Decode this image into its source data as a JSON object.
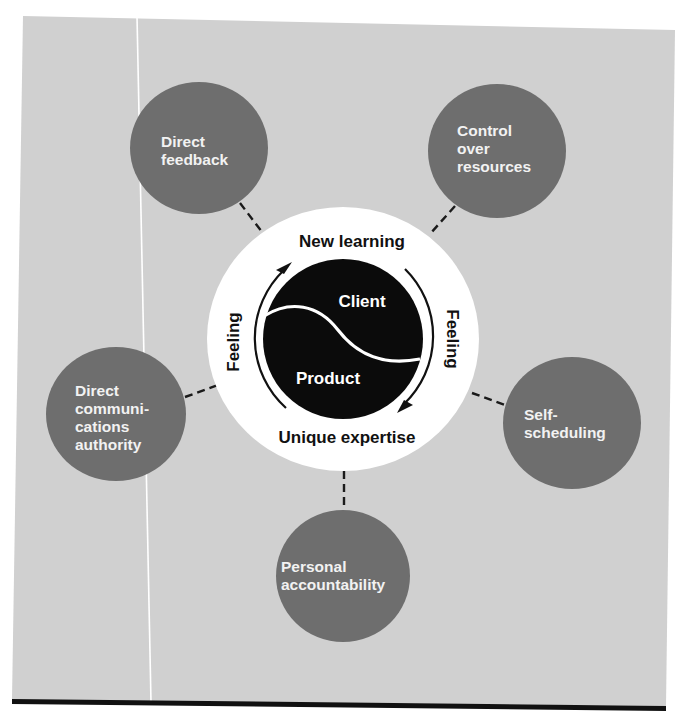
{
  "diagram": {
    "colors": {
      "page": "#ffffff",
      "panel": "#d0d0d0",
      "satellite": "#6e6e6e",
      "satellite_text": "#f2f2f2",
      "center_ring": "#ffffff",
      "center_core": "#0b0b0b",
      "core_text": "#ffffff",
      "ring_text": "#111111",
      "connector": "#1a1a1a",
      "bottom_rule": "#111111",
      "panel_fold_line": "#ffffff"
    },
    "center": {
      "top_label": "New learning",
      "bottom_label": "Unique expertise",
      "left_label": "Feeling",
      "right_label": "Feeling",
      "core": {
        "upper_label": "Client",
        "lower_label": "Product"
      }
    },
    "satellites": [
      {
        "id": "direct-feedback",
        "lines": [
          "Direct",
          "feedback"
        ]
      },
      {
        "id": "control-over-resources",
        "lines": [
          "Control",
          "over",
          "resources"
        ]
      },
      {
        "id": "direct-communications-authority",
        "lines": [
          "Direct",
          "communi-",
          "cations",
          "authority"
        ]
      },
      {
        "id": "self-scheduling",
        "lines": [
          "Self-",
          "scheduling"
        ]
      },
      {
        "id": "personal-accountability",
        "lines": [
          "Personal",
          "accountability"
        ]
      }
    ]
  }
}
